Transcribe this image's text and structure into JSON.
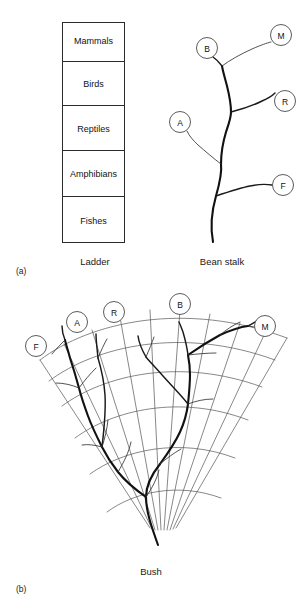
{
  "figure": {
    "width": 301,
    "height": 605,
    "background": "#ffffff",
    "ink": "#111111"
  },
  "panels": [
    {
      "id": "a",
      "letter": "(a)",
      "letter_pos": {
        "x": 22,
        "y": 270
      },
      "diagrams": [
        "ladder",
        "bean-stalk"
      ]
    },
    {
      "id": "b",
      "letter": "(b)",
      "letter_pos": {
        "x": 22,
        "y": 589
      },
      "diagrams": [
        "bush"
      ]
    }
  ],
  "ladder": {
    "caption": "Ladder",
    "caption_pos": {
      "x": 95,
      "y": 262
    },
    "box": {
      "x": 62,
      "y": 22,
      "width": 63,
      "height": 221
    },
    "rungs": [
      {
        "label": "Mammals",
        "code": "M",
        "y_center": 40
      },
      {
        "label": "Birds",
        "code": "B",
        "y_center": 84
      },
      {
        "label": "Reptiles",
        "code": "R",
        "y_center": 128
      },
      {
        "label": "Amphibians",
        "code": "A",
        "y_center": 173
      },
      {
        "label": "Fishes",
        "code": "F",
        "y_center": 221
      }
    ]
  },
  "bean_stalk": {
    "caption": "Bean stalk",
    "caption_pos": {
      "x": 222,
      "y": 262
    },
    "nodes": [
      {
        "code": "M",
        "cx": 281,
        "cy": 35,
        "r": 10.5
      },
      {
        "code": "B",
        "cx": 207,
        "cy": 48,
        "r": 10.5
      },
      {
        "code": "R",
        "cx": 285,
        "cy": 101,
        "r": 10.5
      },
      {
        "code": "A",
        "cx": 180,
        "cy": 122,
        "r": 10.5
      },
      {
        "code": "F",
        "cx": 283,
        "cy": 185,
        "r": 10.5
      }
    ],
    "root": {
      "x": 213,
      "y": 242
    }
  },
  "bush": {
    "caption": "Bush",
    "caption_pos": {
      "x": 151,
      "y": 572
    },
    "nodes": [
      {
        "code": "F",
        "cx": 36,
        "cy": 346,
        "r": 10.5
      },
      {
        "code": "A",
        "cx": 77,
        "cy": 322,
        "r": 10.5
      },
      {
        "code": "R",
        "cx": 114,
        "cy": 312,
        "r": 10.5
      },
      {
        "code": "B",
        "cx": 180,
        "cy": 304,
        "r": 10.5
      },
      {
        "code": "M",
        "cx": 265,
        "cy": 326,
        "r": 10.5
      }
    ],
    "root": {
      "x": 158,
      "y": 545
    },
    "fan": {
      "apex": {
        "x": 168,
        "y": 560
      },
      "arc_count": 5,
      "radial_count": 10
    }
  }
}
